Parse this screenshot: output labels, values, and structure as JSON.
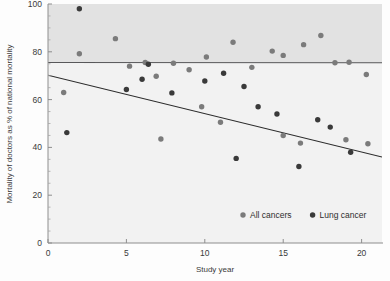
{
  "chart_data": {
    "type": "scatter",
    "title": "",
    "xlabel": "Study year",
    "ylabel": "Mortality of doctors as % of national mortality",
    "xlim": [
      0,
      21.3
    ],
    "ylim": [
      0,
      100
    ],
    "xticks": [
      0,
      5,
      10,
      15,
      20
    ],
    "xticklabels": [
      "0",
      "5",
      "10",
      "15",
      "20"
    ],
    "yticks": [
      0,
      20,
      40,
      60,
      80,
      100
    ],
    "yticklabels": [
      "0",
      "20",
      "40",
      "60",
      "80",
      "100"
    ],
    "grid": false,
    "legend_position": "lower right",
    "series": [
      {
        "name": "All cancers",
        "color": "#7b7b7b",
        "marker": "circle",
        "points": [
          {
            "x": 1.0,
            "y": 63.0
          },
          {
            "x": 2.0,
            "y": 79.2
          },
          {
            "x": 4.3,
            "y": 85.5
          },
          {
            "x": 5.2,
            "y": 74.0
          },
          {
            "x": 6.2,
            "y": 75.5
          },
          {
            "x": 6.9,
            "y": 69.8
          },
          {
            "x": 8.0,
            "y": 75.2
          },
          {
            "x": 9.0,
            "y": 72.5
          },
          {
            "x": 10.1,
            "y": 77.8
          },
          {
            "x": 11.8,
            "y": 84.0
          },
          {
            "x": 13.0,
            "y": 73.5
          },
          {
            "x": 14.3,
            "y": 80.3
          },
          {
            "x": 15.0,
            "y": 78.5
          },
          {
            "x": 16.3,
            "y": 83.0
          },
          {
            "x": 17.4,
            "y": 86.8
          },
          {
            "x": 18.3,
            "y": 75.4
          },
          {
            "x": 19.2,
            "y": 75.6
          },
          {
            "x": 20.3,
            "y": 70.5
          },
          {
            "x": 7.2,
            "y": 43.5
          },
          {
            "x": 9.8,
            "y": 57.0
          },
          {
            "x": 11.0,
            "y": 50.5
          },
          {
            "x": 15.0,
            "y": 45.0
          },
          {
            "x": 16.1,
            "y": 41.8
          },
          {
            "x": 19.0,
            "y": 43.2
          },
          {
            "x": 20.4,
            "y": 41.5
          }
        ]
      },
      {
        "name": "Lung cancer",
        "color": "#3a3a3a",
        "marker": "circle",
        "points": [
          {
            "x": 2.0,
            "y": 98.0
          },
          {
            "x": 1.2,
            "y": 46.2
          },
          {
            "x": 5.0,
            "y": 64.2
          },
          {
            "x": 6.0,
            "y": 68.5
          },
          {
            "x": 6.4,
            "y": 74.8
          },
          {
            "x": 7.9,
            "y": 62.8
          },
          {
            "x": 10.0,
            "y": 67.8
          },
          {
            "x": 11.2,
            "y": 71.0
          },
          {
            "x": 12.5,
            "y": 65.5
          },
          {
            "x": 12.0,
            "y": 35.4
          },
          {
            "x": 13.4,
            "y": 57.0
          },
          {
            "x": 14.6,
            "y": 54.0
          },
          {
            "x": 16.0,
            "y": 32.0
          },
          {
            "x": 17.2,
            "y": 51.6
          },
          {
            "x": 18.0,
            "y": 48.5
          },
          {
            "x": 19.3,
            "y": 38.0
          }
        ]
      }
    ],
    "trendlines": [
      {
        "name": "All cancers trend",
        "color": "#58585a",
        "from": {
          "x": 0,
          "y": 75.5
        },
        "to": {
          "x": 21.3,
          "y": 75.4
        }
      },
      {
        "name": "Lung cancer trend",
        "color": "#2b2b2b",
        "from": {
          "x": 0,
          "y": 70.2
        },
        "to": {
          "x": 21.3,
          "y": 36.0
        }
      }
    ],
    "legend": [
      {
        "label": "All cancers",
        "color": "#7b7b7b"
      },
      {
        "label": "Lung cancer",
        "color": "#3a3a3a"
      }
    ]
  }
}
